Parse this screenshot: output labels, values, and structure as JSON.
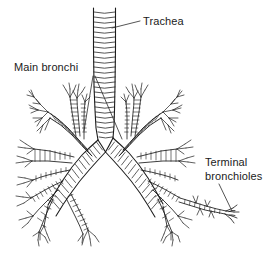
{
  "figure": {
    "background_color": "#ffffff",
    "ink_color": "#1b1b1b",
    "width": 277,
    "height": 258
  },
  "labels": {
    "trachea": {
      "text": "Trachea",
      "x": 143,
      "y": 15
    },
    "main_bronchi": {
      "text": "Main bronchi",
      "x": 14,
      "y": 61
    },
    "terminal_bronchioles": {
      "line1": "Terminal",
      "line2": "bronchioles",
      "x": 205,
      "y": 155
    }
  },
  "structures": {
    "trachea": {
      "name": "trachea",
      "description": "vertical ringed airway tube",
      "cartilage_rings": 22
    },
    "carina": {
      "name": "carina",
      "x": 105,
      "y": 145
    },
    "left_main_bronchus": {
      "name": "left-main-bronchus"
    },
    "right_main_bronchus": {
      "name": "right-main-bronchus"
    },
    "terminal_bronchiole_tip": {
      "name": "terminal-bronchiole-tip",
      "x": 230,
      "y": 212
    }
  },
  "leader_lines": {
    "trachea": {
      "from_x": 112,
      "from_y": 28,
      "to_x": 140,
      "to_y": 21
    },
    "main_bronchi_left": {
      "from_x": 93,
      "from_y": 76,
      "to_x": 84,
      "to_y": 131
    },
    "main_bronchi_right": {
      "from_x": 95,
      "from_y": 76,
      "to_x": 122,
      "to_y": 139
    },
    "terminal_bronchioles": {
      "from_x": 219,
      "from_y": 184,
      "to_x": 232,
      "to_y": 211
    }
  }
}
